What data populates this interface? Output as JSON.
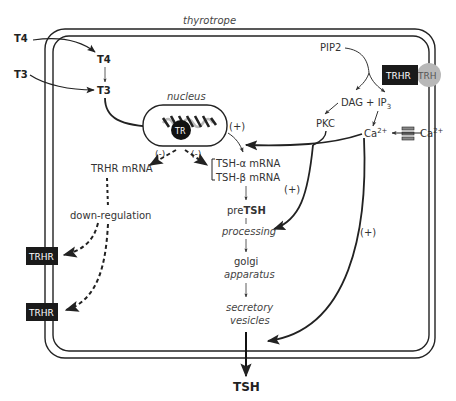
{
  "diagram": {
    "cell_label": "thyrotrope",
    "nucleus_label": "nucleus",
    "tr_label": "TR",
    "inputs": {
      "t4_outside": "T4",
      "t3_outside": "T3",
      "t4_inside": "T4",
      "t3_inside": "T3"
    },
    "receptor": {
      "trhr": "TRHR",
      "trh": "TRH"
    },
    "signaling": {
      "pip2": "PIP2",
      "dag_ip3": "DAG + IP",
      "ip3_sub": "3",
      "pkc": "PKC",
      "ca_inside": "Ca",
      "ca_outside": "Ca",
      "ca_sup": "2+"
    },
    "regulation": {
      "neg1": "(-)",
      "neg2": "(-)",
      "pos_nucleus": "(+)",
      "pos_pkc": "(+)",
      "pos_ca": "(+)"
    },
    "mrna": {
      "trhr_mrna": "TRHR mRNA",
      "tsh_alpha": "TSH-α mRNA",
      "tsh_beta": "TSH-β mRNA"
    },
    "down_regulation": "down-regulation",
    "membrane_receptors": [
      "TRHR",
      "TRHR"
    ],
    "pathway": {
      "pre": "pre",
      "pre_bold": "TSH",
      "processing": "processing",
      "golgi": "golgi",
      "apparatus": "apparatus",
      "secretory": "secretory",
      "vesicles": "vesicles"
    },
    "output": "TSH"
  }
}
